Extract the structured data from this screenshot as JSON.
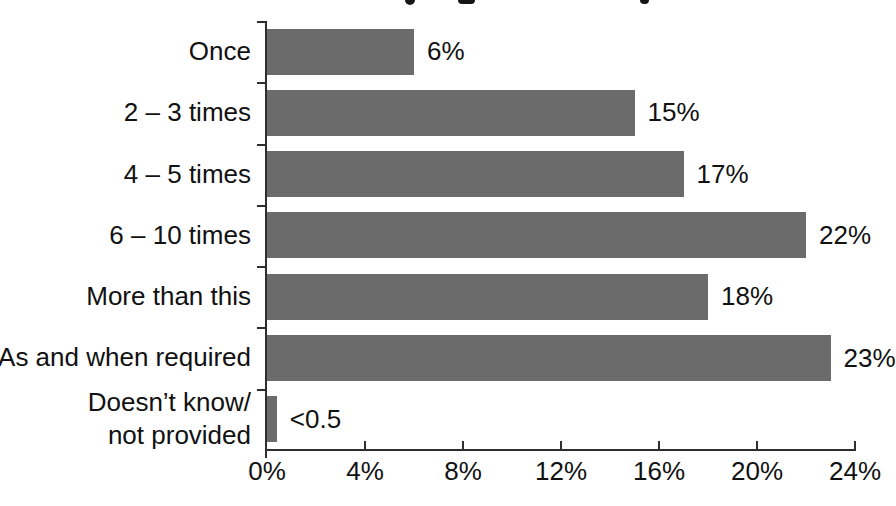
{
  "page": {
    "background": "#ffffff"
  },
  "chart_data": {
    "type": "bar",
    "orientation": "horizontal",
    "title": "",
    "categories": [
      "Once",
      "2 – 3 times",
      "4 – 5 times",
      "6 – 10 times",
      "More than this",
      "As and when required",
      "Doesn’t know/ not provided"
    ],
    "category_label_lines": [
      [
        "Once"
      ],
      [
        "2 – 3 times"
      ],
      [
        "4 – 5 times"
      ],
      [
        "6 – 10 times"
      ],
      [
        "More than this"
      ],
      [
        "As and when required"
      ],
      [
        "Doesn’t know/",
        "not provided"
      ]
    ],
    "values": [
      6,
      15,
      17,
      22,
      18,
      23,
      0.4
    ],
    "value_labels": [
      "6%",
      "15%",
      "17%",
      "22%",
      "18%",
      "23%",
      "<0.5"
    ],
    "xlim": [
      0,
      24
    ],
    "x_ticks": [
      0,
      4,
      8,
      12,
      16,
      20,
      24
    ],
    "x_tick_labels": [
      "0%",
      "4%",
      "8%",
      "12%",
      "16%",
      "20%",
      "24%"
    ],
    "xlabel": "",
    "ylabel": "",
    "legend": "none",
    "grid": false,
    "bar_color": "#6b6b6b",
    "axis_color": "#2e2e2e",
    "text_color": "#111111"
  }
}
